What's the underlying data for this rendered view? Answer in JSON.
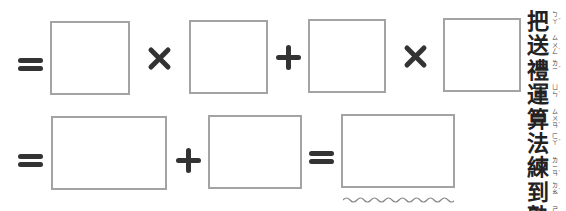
{
  "worksheet": {
    "row1": {
      "operators": [
        "=",
        "×",
        "+",
        "×"
      ],
      "boxes": [
        "",
        "",
        "",
        ""
      ]
    },
    "row2": {
      "operators": [
        "=",
        "+",
        "="
      ],
      "boxes": [
        "",
        "",
        ""
      ],
      "answer_marker": "wavy-underline"
    },
    "side_title": {
      "characters": [
        {
          "han": "把",
          "zhuyin": "ㄅㄚˇ"
        },
        {
          "han": "送",
          "zhuyin": "ㄙㄨㄥˋ"
        },
        {
          "han": "禮",
          "zhuyin": "ㄌㄧˇ"
        },
        {
          "han": "運",
          "zhuyin": "ㄩㄣˋ"
        },
        {
          "han": "算",
          "zhuyin": "ㄙㄨㄢˋ"
        },
        {
          "han": "法",
          "zhuyin": "ㄈㄚˇ"
        },
        {
          "han": "練",
          "zhuyin": "ㄌㄧㄢˋ"
        },
        {
          "han": "到",
          "zhuyin": "ㄉㄠˋ"
        },
        {
          "han": "熟",
          "zhuyin": "ㄕㄡˊ"
        }
      ]
    }
  },
  "colors": {
    "operator": "#333333",
    "box_border": "#a3a3a3",
    "background": "#ffffff"
  }
}
